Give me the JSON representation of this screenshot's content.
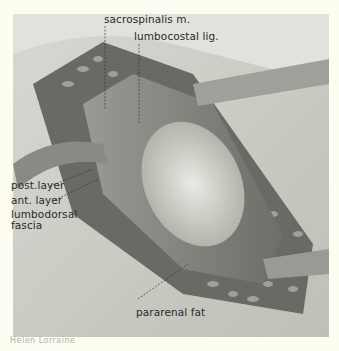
{
  "figure": {
    "labels": {
      "sacrospinalis": "sacrospinalis m.",
      "lumbocostal": "lumbocostal lig.",
      "post_layer": "post.layer",
      "ant_layer": "ant. layer",
      "lumbodorsal": "lumbodorsal",
      "fascia": "fascia",
      "pararenal_fat": "pararenal fat"
    },
    "signature": "Helen Lorraine"
  },
  "colors": {
    "background": "#fdfdf2",
    "plate": "#e6e6e0",
    "ink": "#2a2a2a"
  }
}
